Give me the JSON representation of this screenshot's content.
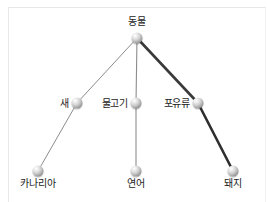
{
  "diagram": {
    "type": "semantic-network-tree",
    "background_color": "#ffffff",
    "node_color": "#9a9a9a",
    "label_color": "#1c1c1c",
    "frame_color": "#e8e8e8"
  },
  "nodes": [
    {
      "id": "animal",
      "label": "동물",
      "x": 137,
      "y": 38,
      "label_x": 137,
      "label_y": 16,
      "label_pos": "above-center"
    },
    {
      "id": "bird",
      "label": "새",
      "x": 77,
      "y": 103,
      "label_x": 69,
      "label_y": 103,
      "label_pos": "left"
    },
    {
      "id": "fish",
      "label": "물고기",
      "x": 136,
      "y": 103,
      "label_x": 128,
      "label_y": 103,
      "label_pos": "left"
    },
    {
      "id": "mammal",
      "label": "포유류",
      "x": 198,
      "y": 103,
      "label_x": 190,
      "label_y": 103,
      "label_pos": "left"
    },
    {
      "id": "canary",
      "label": "카나리아",
      "x": 38,
      "y": 171,
      "label_x": 38,
      "label_y": 178,
      "label_pos": "below-center"
    },
    {
      "id": "salmon",
      "label": "연어",
      "x": 136,
      "y": 171,
      "label_x": 136,
      "label_y": 178,
      "label_pos": "below-center"
    },
    {
      "id": "pig",
      "label": "돼지",
      "x": 233,
      "y": 171,
      "label_x": 233,
      "label_y": 178,
      "label_pos": "below-center"
    }
  ],
  "edges": [
    {
      "id": "animal-bird",
      "from": "animal",
      "to": "bird",
      "x1": 137,
      "y1": 38,
      "x2": 77,
      "y2": 103,
      "width": 1.0,
      "color": "#8c8c8c"
    },
    {
      "id": "animal-fish",
      "from": "animal",
      "to": "fish",
      "x1": 137,
      "y1": 38,
      "x2": 136,
      "y2": 103,
      "width": 1.1,
      "color": "#8c8c8c"
    },
    {
      "id": "animal-mammal",
      "from": "animal",
      "to": "mammal",
      "x1": 137,
      "y1": 38,
      "x2": 198,
      "y2": 103,
      "width": 2.6,
      "color": "#3a3a3a"
    },
    {
      "id": "bird-canary",
      "from": "bird",
      "to": "canary",
      "x1": 77,
      "y1": 103,
      "x2": 38,
      "y2": 171,
      "width": 1.0,
      "color": "#8c8c8c"
    },
    {
      "id": "fish-salmon",
      "from": "fish",
      "to": "salmon",
      "x1": 136,
      "y1": 103,
      "x2": 136,
      "y2": 171,
      "width": 1.1,
      "color": "#8c8c8c"
    },
    {
      "id": "mammal-pig",
      "from": "mammal",
      "to": "pig",
      "x1": 198,
      "y1": 103,
      "x2": 233,
      "y2": 171,
      "width": 2.6,
      "color": "#2e2e2e"
    }
  ]
}
